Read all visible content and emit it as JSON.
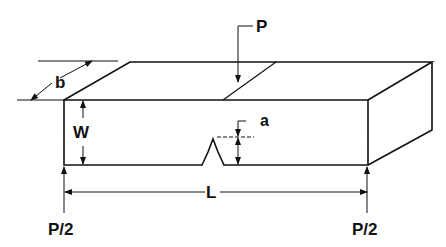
{
  "diagram": {
    "type": "notched-beam-three-point-bend-specimen",
    "labels": {
      "load": "P",
      "support_left": "P/2",
      "support_right": "P/2",
      "thickness": "b",
      "width": "W",
      "notch_depth": "a",
      "span": "L"
    },
    "colors": {
      "line": "#111111",
      "background": "#ffffff"
    }
  }
}
